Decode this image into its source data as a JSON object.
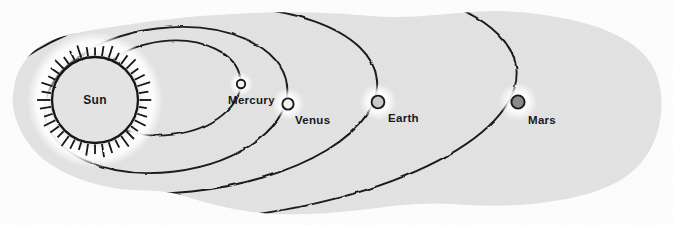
{
  "diagram": {
    "kind": "astronomy-orbit-diagram",
    "background_color": "#e3e3e3",
    "page_color": "#ffffff",
    "ink_color": "#1a1a1a",
    "glow_color": "#ffffff",
    "center_body": {
      "name": "sun",
      "label": "Sun",
      "cx": 95,
      "cy": 100,
      "r": 43,
      "fill": "#e3e3e3",
      "ray_count": 40,
      "ray_length": 11
    },
    "planets": [
      {
        "name": "mercury",
        "label": "Mercury",
        "cx": 241,
        "cy": 84,
        "r": 4.2,
        "fill": "#f2f2f2",
        "label_x": 228,
        "label_y": 104,
        "label_anchor": "start",
        "orbit": {
          "rx": 74,
          "ry": 47,
          "cx": 167,
          "cy": 88,
          "rotation": -7
        }
      },
      {
        "name": "venus",
        "label": "Venus",
        "cx": 288,
        "cy": 104,
        "r": 5.6,
        "fill": "#f2f2f2",
        "label_x": 295,
        "label_y": 124,
        "label_anchor": "start",
        "orbit": {
          "rx": 122,
          "ry": 72,
          "cx": 166,
          "cy": 100,
          "rotation": -7
        }
      },
      {
        "name": "earth",
        "label": "Earth",
        "cx": 378,
        "cy": 102,
        "r": 6.4,
        "fill": "#c9c9c9",
        "label_x": 388,
        "label_y": 122,
        "label_anchor": "start",
        "orbit": {
          "rx": 196,
          "ry": 92,
          "cx": 182,
          "cy": 100,
          "rotation": -6
        }
      },
      {
        "name": "mars",
        "label": "Mars",
        "cx": 518,
        "cy": 102,
        "r": 6.6,
        "fill": "#8a8a8a",
        "label_x": 528,
        "label_y": 124,
        "label_anchor": "start",
        "orbit": {
          "rx": 300,
          "ry": 118,
          "cx": 218,
          "cy": 100,
          "rotation": -6
        }
      }
    ],
    "labels_order": [
      "Sun",
      "Mercury",
      "Venus",
      "Earth",
      "Mars"
    ]
  }
}
